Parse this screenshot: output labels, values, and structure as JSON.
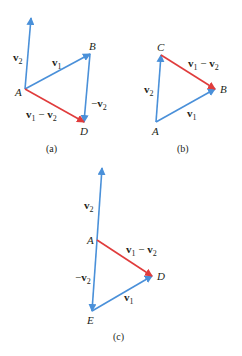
{
  "colors": {
    "blue": "#4a90d9",
    "red": "#e03c3c",
    "text": "#231f20",
    "background": "#ffffff"
  },
  "panels": [
    {
      "caption": "(a)",
      "points": {
        "A": "A",
        "B": "B",
        "D": "D"
      },
      "vectors": [
        {
          "label_main": "v",
          "label_sub": "2",
          "prefix": "",
          "color": "blue"
        },
        {
          "label_main": "v",
          "label_sub": "1",
          "prefix": "",
          "color": "blue"
        },
        {
          "label_main": "v",
          "label_sub": "2",
          "prefix": "−",
          "color": "blue"
        },
        {
          "label": "v1 − v2",
          "color": "red"
        }
      ]
    },
    {
      "caption": "(b)",
      "points": {
        "A": "A",
        "B": "B",
        "C": "C"
      },
      "vectors": [
        {
          "label_main": "v",
          "label_sub": "2",
          "color": "blue"
        },
        {
          "label_main": "v",
          "label_sub": "1",
          "color": "blue"
        },
        {
          "label": "v1 − v2",
          "color": "red"
        }
      ]
    },
    {
      "caption": "(c)",
      "points": {
        "A": "A",
        "D": "D",
        "E": "E"
      },
      "vectors": [
        {
          "label_main": "v",
          "label_sub": "2",
          "color": "blue"
        },
        {
          "label_main": "v",
          "label_sub": "2",
          "prefix": "−",
          "color": "blue"
        },
        {
          "label_main": "v",
          "label_sub": "1",
          "color": "blue"
        },
        {
          "label": "v1 − v2",
          "color": "red"
        }
      ]
    }
  ],
  "text": {
    "v": "v",
    "s1": "1",
    "s2": "2",
    "minus": "−",
    "minus_sp": " − ",
    "A": "A",
    "B": "B",
    "C": "C",
    "D": "D",
    "E": "E",
    "cap_a": "(a)",
    "cap_b": "(b)",
    "cap_c": "(c)"
  }
}
